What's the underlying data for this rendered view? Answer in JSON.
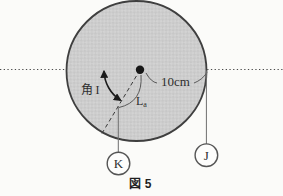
{
  "figure": {
    "caption": "図 5",
    "angle_label": "角 I",
    "radius_label": "10cm",
    "arc_label": {
      "base": "L",
      "subscript": "a"
    },
    "weight_k": "K",
    "weight_j": "J"
  },
  "colors": {
    "background": "#fbfbf9",
    "disk_fill_light": "#d3d3d3",
    "disk_fill_dark": "#c7c7c7",
    "disk_stroke": "#3f3f3f",
    "ink": "#2e2e2e",
    "string": "#6e6e6e"
  }
}
